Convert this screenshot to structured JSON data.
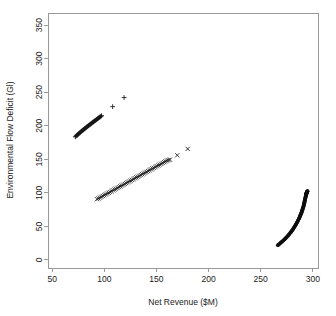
{
  "chart_data": {
    "type": "scatter",
    "title": "",
    "subtitle": "",
    "xlabel": "Net Revenue ($M)",
    "ylabel": "Environmental Flow Deficit (Gl)",
    "xlim": [
      46,
      305
    ],
    "ylim": [
      -12,
      368
    ],
    "xticks": [
      50,
      100,
      150,
      200,
      250,
      300
    ],
    "xtick_labels": [
      "50",
      "100",
      "150",
      "200",
      "250",
      "300"
    ],
    "yticks": [
      0,
      50,
      100,
      150,
      200,
      250,
      300,
      350
    ],
    "ytick_labels": [
      "0",
      "50",
      "100",
      "150",
      "200",
      "250",
      "300",
      "350"
    ],
    "grid": false,
    "legend": null,
    "legend_position": "none",
    "annotations": [],
    "marker_color": "#111111",
    "axis_color": "#9a9a9a",
    "background_color": "#ffffff",
    "series": [
      {
        "name": "upper-band",
        "marker": "plus",
        "x": [
          72.2,
          72.8,
          73.4,
          74.0,
          74.6,
          75.2,
          75.8,
          76.4,
          77.0,
          77.6,
          78.2,
          78.8,
          79.4,
          80.0,
          80.6,
          81.2,
          81.8,
          82.4,
          83.0,
          83.6,
          84.2,
          84.8,
          85.4,
          86.0,
          86.6,
          87.2,
          87.8,
          88.4,
          89.0,
          89.6,
          90.2,
          90.8,
          91.4,
          92.0,
          92.6,
          93.2,
          93.8,
          94.4,
          95.0,
          95.6,
          96.2,
          96.8,
          97.4,
          108.0,
          119.0
        ],
        "y": [
          183.5,
          184.4,
          185.3,
          186.1,
          186.9,
          187.8,
          188.6,
          189.4,
          190.2,
          191.0,
          191.8,
          192.6,
          193.4,
          194.1,
          194.9,
          195.6,
          196.4,
          197.1,
          197.9,
          198.6,
          199.3,
          200.1,
          200.8,
          201.5,
          202.2,
          203.0,
          203.7,
          204.4,
          205.1,
          205.8,
          206.5,
          207.2,
          207.9,
          208.6,
          209.3,
          210.0,
          210.7,
          211.4,
          212.1,
          212.8,
          213.5,
          214.2,
          215.0,
          228.5,
          242.0
        ]
      },
      {
        "name": "middle-band",
        "marker": "cross",
        "x": [
          93.0,
          94.4,
          95.8,
          97.2,
          98.6,
          100.0,
          101.4,
          102.8,
          104.2,
          105.6,
          107.0,
          108.4,
          109.8,
          111.2,
          112.6,
          114.0,
          115.4,
          116.8,
          118.2,
          119.6,
          121.0,
          122.4,
          123.8,
          125.2,
          126.6,
          128.0,
          129.4,
          130.8,
          132.2,
          133.6,
          135.0,
          136.4,
          137.8,
          139.2,
          140.6,
          142.0,
          143.4,
          144.8,
          146.2,
          147.6,
          149.0,
          150.4,
          151.8,
          153.2,
          154.6,
          156.0,
          157.4,
          158.8,
          160.2,
          161.6,
          163.0,
          170.0,
          180.0
        ],
        "y": [
          90.5,
          91.7,
          92.9,
          94.1,
          95.3,
          96.5,
          97.7,
          98.9,
          100.1,
          101.3,
          102.5,
          103.7,
          104.9,
          106.1,
          107.3,
          108.5,
          109.7,
          110.9,
          112.1,
          113.3,
          114.5,
          115.7,
          116.9,
          118.1,
          119.3,
          120.5,
          121.7,
          122.9,
          124.1,
          125.3,
          126.5,
          127.7,
          128.9,
          130.1,
          131.3,
          132.5,
          133.7,
          134.9,
          136.1,
          137.3,
          138.5,
          139.7,
          140.9,
          142.1,
          143.3,
          144.5,
          145.7,
          146.9,
          148.1,
          148.8,
          149.5,
          156.0,
          165.5
        ]
      },
      {
        "name": "lower-right-arc",
        "marker": "dot",
        "x": [
          266.5,
          267.4,
          268.3,
          269.2,
          270.1,
          271.0,
          271.9,
          272.8,
          273.6,
          274.4,
          275.2,
          276.0,
          276.8,
          277.5,
          278.2,
          278.9,
          279.6,
          280.3,
          280.9,
          281.5,
          282.1,
          282.7,
          283.3,
          283.9,
          284.4,
          284.9,
          285.4,
          285.9,
          286.4,
          286.9,
          287.3,
          287.7,
          288.1,
          288.5,
          288.9,
          289.3,
          289.6,
          289.9,
          290.2,
          290.5,
          290.8,
          291.1,
          291.4,
          291.6,
          291.8,
          292.0,
          292.2,
          292.4,
          292.6,
          292.8,
          293.0,
          293.2,
          293.3,
          293.4,
          293.5,
          293.6,
          293.7,
          293.8,
          293.9,
          294.0,
          294.1,
          294.2,
          294.3,
          294.4,
          294.5,
          294.6,
          294.7,
          294.8,
          294.85,
          294.9
        ],
        "y": [
          22.0,
          23.2,
          24.4,
          25.6,
          26.8,
          28.0,
          29.3,
          30.6,
          31.9,
          33.2,
          34.5,
          35.8,
          37.2,
          38.6,
          40.0,
          41.4,
          42.8,
          44.2,
          45.6,
          47.1,
          48.6,
          50.1,
          51.6,
          53.1,
          54.6,
          56.1,
          57.6,
          59.1,
          60.6,
          62.1,
          63.6,
          65.1,
          66.6,
          68.1,
          69.6,
          71.1,
          72.6,
          74.1,
          75.6,
          77.1,
          78.6,
          80.1,
          81.6,
          83.1,
          84.6,
          86.1,
          87.6,
          89.1,
          90.6,
          92.1,
          93.4,
          94.6,
          95.7,
          96.6,
          97.3,
          97.9,
          98.4,
          98.8,
          99.2,
          99.6,
          99.9,
          100.2,
          100.5,
          100.8,
          101.1,
          101.4,
          101.7,
          102.0,
          102.3,
          102.6
        ]
      }
    ]
  }
}
